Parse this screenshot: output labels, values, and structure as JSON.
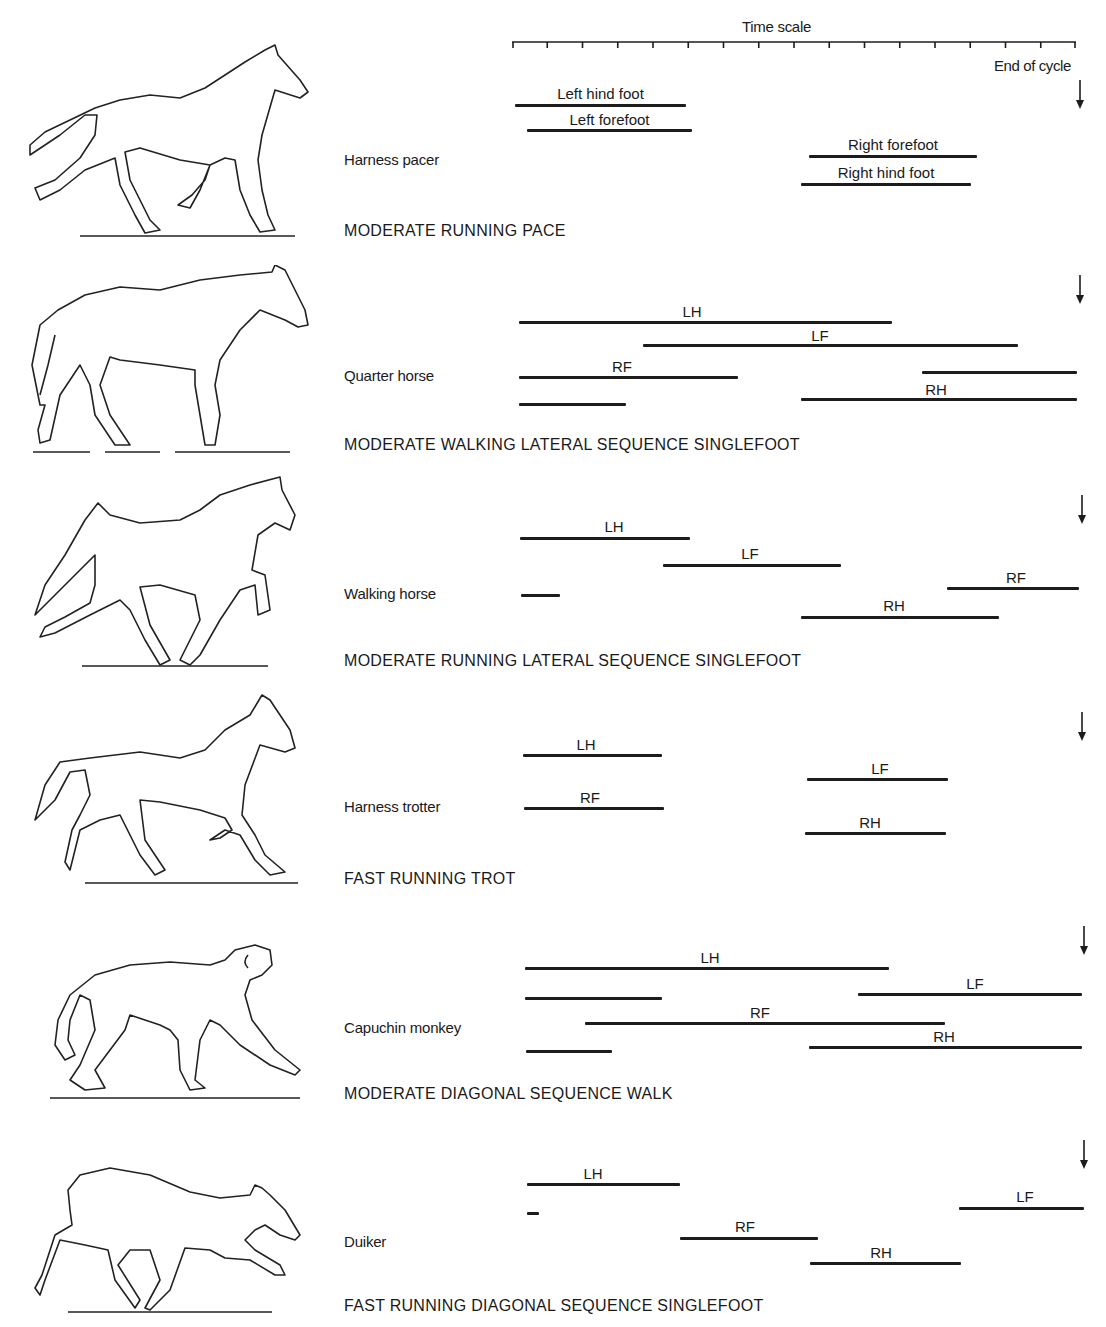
{
  "timescale": {
    "title": "Time scale",
    "ticks": 16,
    "x_start_px": 512,
    "x_end_px": 1076,
    "end_label": "End of cycle"
  },
  "chart_data": {
    "type": "gantt",
    "title": "Time scale",
    "xlabel": "Time scale (one stride cycle)",
    "x_range": [
      0,
      16
    ],
    "x_ticks": [
      0,
      1,
      2,
      3,
      4,
      5,
      6,
      7,
      8,
      9,
      10,
      11,
      12,
      13,
      14,
      15,
      16
    ],
    "annotation": "End of cycle",
    "panels": [
      {
        "animal": "Harness pacer",
        "gait": "MODERATE RUNNING PACE",
        "bars": [
          {
            "label": "Left hind foot",
            "start": 0.1,
            "end": 4.9
          },
          {
            "label": "Left forefoot",
            "start": 0.4,
            "end": 5.1
          },
          {
            "label": "Right forefoot",
            "start": 8.4,
            "end": 13.2
          },
          {
            "label": "Right hind foot",
            "start": 8.2,
            "end": 13.0
          }
        ]
      },
      {
        "animal": "Quarter horse",
        "gait": "MODERATE WALKING LATERAL SEQUENCE SINGLEFOOT",
        "bars": [
          {
            "label": "LH",
            "start": 0.2,
            "end": 10.8
          },
          {
            "label": "LF",
            "start": 3.7,
            "end": 14.4
          },
          {
            "label": "RF",
            "start": 0.2,
            "end": 6.4
          },
          {
            "label": "RF",
            "start": 11.6,
            "end": 16.0
          },
          {
            "label": "RH",
            "start": 0.2,
            "end": 3.2
          },
          {
            "label": "RH",
            "start": 8.2,
            "end": 16.0
          }
        ]
      },
      {
        "animal": "Walking horse",
        "gait": "MODERATE RUNNING LATERAL SEQUENCE SINGLEFOOT",
        "bars": [
          {
            "label": "LH",
            "start": 0.2,
            "end": 5.1
          },
          {
            "label": "LF",
            "start": 4.3,
            "end": 9.3
          },
          {
            "label": "RF",
            "start": 0.3,
            "end": 1.4
          },
          {
            "label": "RF",
            "start": 12.3,
            "end": 16.1
          },
          {
            "label": "RH",
            "start": 8.2,
            "end": 13.8
          }
        ]
      },
      {
        "animal": "Harness trotter",
        "gait": "FAST RUNNING TROT",
        "bars": [
          {
            "label": "LH",
            "start": 0.3,
            "end": 4.3
          },
          {
            "label": "RF",
            "start": 0.3,
            "end": 4.3
          },
          {
            "label": "LF",
            "start": 8.4,
            "end": 12.4
          },
          {
            "label": "RH",
            "start": 8.3,
            "end": 12.3
          }
        ]
      },
      {
        "animal": "Capuchin monkey",
        "gait": "MODERATE DIAGONAL SEQUENCE WALK",
        "bars": [
          {
            "label": "LH",
            "start": 0.4,
            "end": 10.7
          },
          {
            "label": "LF",
            "start": 0.4,
            "end": 4.3
          },
          {
            "label": "LF",
            "start": 9.8,
            "end": 16.2
          },
          {
            "label": "RF",
            "start": 2.1,
            "end": 12.3
          },
          {
            "label": "RH",
            "start": 0.4,
            "end": 2.8
          },
          {
            "label": "RH",
            "start": 8.4,
            "end": 16.2
          }
        ]
      },
      {
        "animal": "Duiker",
        "gait": "FAST RUNNING DIAGONAL SEQUENCE SINGLEFOOT",
        "bars": [
          {
            "label": "LH",
            "start": 0.4,
            "end": 4.8
          },
          {
            "label": "LF",
            "start": 0.4,
            "end": 0.8
          },
          {
            "label": "LF",
            "start": 12.7,
            "end": 16.2
          },
          {
            "label": "RF",
            "start": 4.8,
            "end": 8.7
          },
          {
            "label": "RH",
            "start": 8.5,
            "end": 12.7
          }
        ]
      }
    ]
  },
  "panels": [
    {
      "animal": "Harness pacer",
      "gait": "MODERATE RUNNING PACE",
      "name_y": 151,
      "gait_y": 222,
      "arrow_y": 80,
      "bars": [
        {
          "x1": 515,
          "x2": 686,
          "y": 104,
          "label": "Left hind foot",
          "ly": 85
        },
        {
          "x1": 527,
          "x2": 692,
          "y": 129,
          "label": "Left forefoot",
          "ly": 111
        },
        {
          "x1": 809,
          "x2": 977,
          "y": 155,
          "label": "Right forefoot",
          "ly": 136
        },
        {
          "x1": 801,
          "x2": 971,
          "y": 183,
          "label": "Right hind foot",
          "ly": 164
        }
      ]
    },
    {
      "animal": "Quarter horse",
      "gait": "MODERATE WALKING LATERAL SEQUENCE SINGLEFOOT",
      "name_y": 367,
      "gait_y": 436,
      "arrow_y": 275,
      "bars": [
        {
          "x1": 519,
          "x2": 892,
          "y": 321,
          "label": "LH",
          "ly": 303,
          "lx": 692
        },
        {
          "x1": 643,
          "x2": 1018,
          "y": 344,
          "label": "LF",
          "ly": 327,
          "lx": 820
        },
        {
          "x1": 519,
          "x2": 738,
          "y": 376,
          "label": "RF",
          "ly": 358,
          "lx": 622
        },
        {
          "x1": 922,
          "x2": 1077,
          "y": 371,
          "label": "",
          "ly": 0
        },
        {
          "x1": 519,
          "x2": 626,
          "y": 403,
          "label": "",
          "ly": 0
        },
        {
          "x1": 801,
          "x2": 1077,
          "y": 398,
          "label": "RH",
          "ly": 381,
          "lx": 936
        }
      ]
    },
    {
      "animal": "Walking horse",
      "gait": "MODERATE RUNNING LATERAL SEQUENCE SINGLEFOOT",
      "name_y": 585,
      "gait_y": 652,
      "arrow_y": 495,
      "bars": [
        {
          "x1": 520,
          "x2": 690,
          "y": 537,
          "label": "LH",
          "ly": 518,
          "lx": 614
        },
        {
          "x1": 663,
          "x2": 841,
          "y": 564,
          "label": "LF",
          "ly": 545,
          "lx": 750
        },
        {
          "x1": 521,
          "x2": 560,
          "y": 594,
          "label": "",
          "ly": 0
        },
        {
          "x1": 947,
          "x2": 1079,
          "y": 587,
          "label": "RF",
          "ly": 569,
          "lx": 1016
        },
        {
          "x1": 801,
          "x2": 999,
          "y": 616,
          "label": "RH",
          "ly": 597,
          "lx": 894
        }
      ]
    },
    {
      "animal": "Harness trotter",
      "gait": "FAST RUNNING TROT",
      "name_y": 798,
      "gait_y": 870,
      "arrow_y": 712,
      "bars": [
        {
          "x1": 523,
          "x2": 662,
          "y": 754,
          "label": "LH",
          "ly": 736,
          "lx": 586
        },
        {
          "x1": 524,
          "x2": 664,
          "y": 807,
          "label": "RF",
          "ly": 789,
          "lx": 590
        },
        {
          "x1": 807,
          "x2": 948,
          "y": 778,
          "label": "LF",
          "ly": 760,
          "lx": 880
        },
        {
          "x1": 805,
          "x2": 946,
          "y": 832,
          "label": "RH",
          "ly": 814,
          "lx": 870
        }
      ]
    },
    {
      "animal": "Capuchin monkey",
      "gait": "MODERATE DIAGONAL SEQUENCE WALK",
      "name_y": 1019,
      "gait_y": 1085,
      "arrow_y": 926,
      "bars": [
        {
          "x1": 525,
          "x2": 889,
          "y": 967,
          "label": "LH",
          "ly": 949,
          "lx": 710
        },
        {
          "x1": 525,
          "x2": 662,
          "y": 997,
          "label": "",
          "ly": 0
        },
        {
          "x1": 858,
          "x2": 1082,
          "y": 993,
          "label": "LF",
          "ly": 975,
          "lx": 975
        },
        {
          "x1": 585,
          "x2": 945,
          "y": 1022,
          "label": "RF",
          "ly": 1004,
          "lx": 760
        },
        {
          "x1": 526,
          "x2": 612,
          "y": 1050,
          "label": "",
          "ly": 0
        },
        {
          "x1": 809,
          "x2": 1082,
          "y": 1046,
          "label": "RH",
          "ly": 1028,
          "lx": 944
        }
      ]
    },
    {
      "animal": "Duiker",
      "gait": "FAST RUNNING DIAGONAL SEQUENCE SINGLEFOOT",
      "name_y": 1233,
      "gait_y": 1297,
      "arrow_y": 1140,
      "bars": [
        {
          "x1": 527,
          "x2": 680,
          "y": 1183,
          "label": "LH",
          "ly": 1165,
          "lx": 593
        },
        {
          "x1": 527,
          "x2": 539,
          "y": 1212,
          "label": "",
          "ly": 0
        },
        {
          "x1": 959,
          "x2": 1084,
          "y": 1207,
          "label": "LF",
          "ly": 1188,
          "lx": 1025
        },
        {
          "x1": 680,
          "x2": 818,
          "y": 1237,
          "label": "RF",
          "ly": 1218,
          "lx": 745
        },
        {
          "x1": 810,
          "x2": 961,
          "y": 1262,
          "label": "RH",
          "ly": 1244,
          "lx": 881
        }
      ]
    }
  ],
  "colors": {
    "ink": "#1c1c1c",
    "background": "#ffffff"
  }
}
